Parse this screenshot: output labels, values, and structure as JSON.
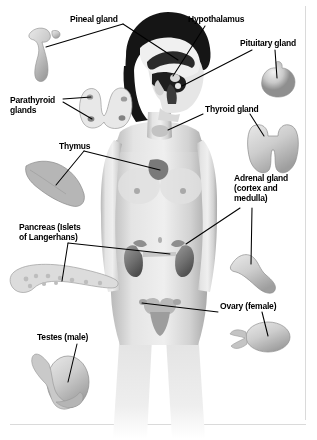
{
  "diagram": {
    "style": "grayscale anatomical illustration",
    "background_color": "#ffffff",
    "text_color": "#000000",
    "leader_line_color": "#000000",
    "width": 317,
    "height": 440
  },
  "labels": [
    {
      "id": "pineal",
      "text": "Pineal gland",
      "x": 70,
      "y": 14,
      "align": "left"
    },
    {
      "id": "hypothalamus",
      "text": "Hypothalamus",
      "x": 188,
      "y": 14,
      "align": "left"
    },
    {
      "id": "pituitary",
      "text": "Pituitary gland",
      "x": 240,
      "y": 38,
      "align": "left"
    },
    {
      "id": "parathyroid",
      "text": "Parathyroid\nglands",
      "x": 10,
      "y": 95,
      "align": "left"
    },
    {
      "id": "thyroid",
      "text": "Thyroid gland",
      "x": 205,
      "y": 104,
      "align": "left"
    },
    {
      "id": "thymus",
      "text": "Thymus",
      "x": 59,
      "y": 141,
      "align": "left"
    },
    {
      "id": "adrenal",
      "text": "Adrenal gland\n(cortex and\nmedulla)",
      "x": 234,
      "y": 173,
      "align": "left"
    },
    {
      "id": "pancreas",
      "text": "Pancreas (Islets\nof Langerhans)",
      "x": 19,
      "y": 222,
      "align": "left"
    },
    {
      "id": "ovary",
      "text": "Ovary (female)",
      "x": 220,
      "y": 301,
      "align": "left"
    },
    {
      "id": "testes",
      "text": "Testes (male)",
      "x": 37,
      "y": 332,
      "align": "left"
    }
  ],
  "organ_illustrations": [
    {
      "id": "pineal-illustration",
      "name": "pineal gland",
      "cx": 50,
      "cy": 48
    },
    {
      "id": "pituitary-illustration",
      "name": "pituitary gland",
      "cx": 278,
      "cy": 80
    },
    {
      "id": "parathyroid-illustration",
      "name": "parathyroid glands",
      "cx": 105,
      "cy": 108
    },
    {
      "id": "thyroid-illustration",
      "name": "thyroid gland",
      "cx": 272,
      "cy": 148
    },
    {
      "id": "thymus-illustration",
      "name": "thymus",
      "cx": 52,
      "cy": 182
    },
    {
      "id": "pancreas-illustration",
      "name": "pancreas",
      "cx": 58,
      "cy": 280
    },
    {
      "id": "adrenal-illustration",
      "name": "adrenal gland",
      "cx": 250,
      "cy": 272
    },
    {
      "id": "ovary-illustration",
      "name": "ovary",
      "cx": 265,
      "cy": 337
    },
    {
      "id": "testes-illustration",
      "name": "testes",
      "cx": 66,
      "cy": 382
    }
  ],
  "body_figure": {
    "name": "female human body",
    "head_hair_color": "#111111",
    "skin_color": "#dcdcdc",
    "organs_shown": [
      "brain cross-section",
      "thyroid",
      "thymus",
      "kidneys",
      "adrenal glands",
      "uterus",
      "ovaries"
    ]
  }
}
